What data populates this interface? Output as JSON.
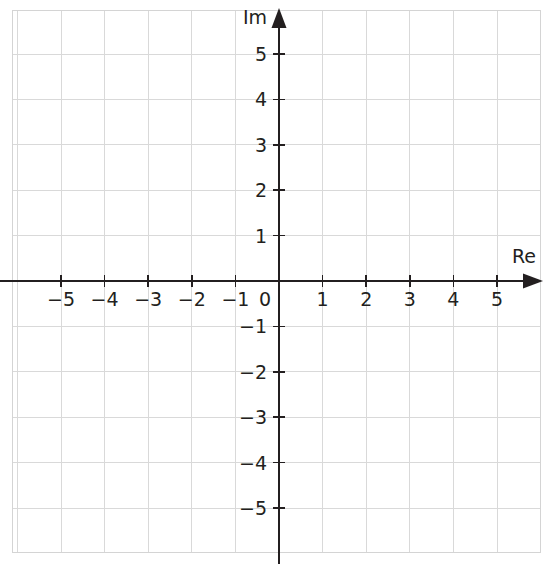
{
  "chart_data": {
    "type": "scatter",
    "title": "",
    "subtitle": "",
    "xlabel": "Re",
    "ylabel": "Im",
    "xlim": [
      -6.1,
      6.0
    ],
    "ylim": [
      -6.0,
      6.2
    ],
    "grid": true,
    "grid_spacing": 1,
    "legend": "none",
    "series": [],
    "x_ticks": [
      {
        "value": -5,
        "label": "−5"
      },
      {
        "value": -4,
        "label": "−4"
      },
      {
        "value": -3,
        "label": "−3"
      },
      {
        "value": -2,
        "label": "−2"
      },
      {
        "value": -1,
        "label": "−1"
      },
      {
        "value": 1,
        "label": "1"
      },
      {
        "value": 2,
        "label": "2"
      },
      {
        "value": 3,
        "label": "3"
      },
      {
        "value": 4,
        "label": "4"
      },
      {
        "value": 5,
        "label": "5"
      }
    ],
    "y_ticks": [
      {
        "value": 5,
        "label": "5"
      },
      {
        "value": 4,
        "label": "4"
      },
      {
        "value": 3,
        "label": "3"
      },
      {
        "value": 2,
        "label": "2"
      },
      {
        "value": 1,
        "label": "1"
      },
      {
        "value": -1,
        "label": "−1"
      },
      {
        "value": -2,
        "label": "−2"
      },
      {
        "value": -3,
        "label": "−3"
      },
      {
        "value": -4,
        "label": "−4"
      },
      {
        "value": -5,
        "label": "−5"
      }
    ],
    "origin_label": "0",
    "annotations": [],
    "data_points": []
  },
  "colors": {
    "background": "#ffffff",
    "grid": "#d9d9d9",
    "grid_border": "#d4d4d4",
    "axis": "#231f20",
    "text": "#231f20"
  },
  "geometry": {
    "width": 551,
    "height": 564,
    "origin_x": 279,
    "origin_y": 281,
    "unit_x": 43.6,
    "unit_y": 45.4,
    "grid_left": 12,
    "grid_right": 540,
    "grid_top": 10,
    "grid_bottom": 552
  }
}
